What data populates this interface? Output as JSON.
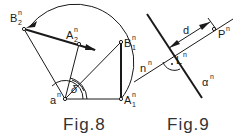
{
  "figures": [
    {
      "caption": "Fig.8",
      "labels": {
        "a": "a",
        "a_sup": "n",
        "A1": "A",
        "A1_sup": "n",
        "A1_sub": "1",
        "B1": "B",
        "B1_sup": "n",
        "B1_sub": "1",
        "A2": "A",
        "A2_sup": "n",
        "A2_sub": "2",
        "B2": "B",
        "B2_sup": "n",
        "B2_sub": "2",
        "angle": "δ"
      }
    },
    {
      "caption": "Fig.9",
      "labels": {
        "d": "d",
        "P": "P",
        "P_sup": "n",
        "L": "L",
        "L_sup": "n",
        "n": "n",
        "n_sup": "n",
        "alpha": "α",
        "alpha_sup": "n"
      }
    }
  ],
  "colors": {
    "line": "#1a1a1a",
    "caption": "#333333",
    "background": "#ffffff"
  }
}
